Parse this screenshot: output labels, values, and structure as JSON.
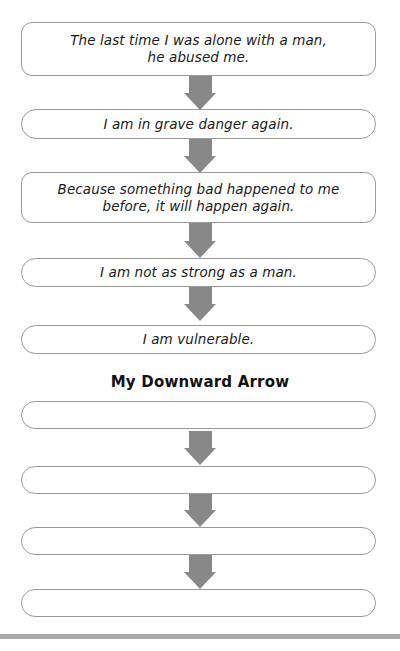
{
  "example_chain": {
    "boxes": [
      {
        "text": "The last time I was alone with a man,\nhe abused me."
      },
      {
        "text": "I am in grave danger again."
      },
      {
        "text": "Because something bad happened to me\nbefore, it will happen again."
      },
      {
        "text": "I am not as strong as a man."
      },
      {
        "text": "I am vulnerable."
      }
    ]
  },
  "worksheet": {
    "heading": "My Downward Arrow",
    "boxes": [
      {
        "text": ""
      },
      {
        "text": ""
      },
      {
        "text": ""
      },
      {
        "text": ""
      }
    ]
  },
  "colors": {
    "arrow": "#888888",
    "box_border": "#9a9a9a",
    "bottom_rule": "#a8a8a8"
  }
}
